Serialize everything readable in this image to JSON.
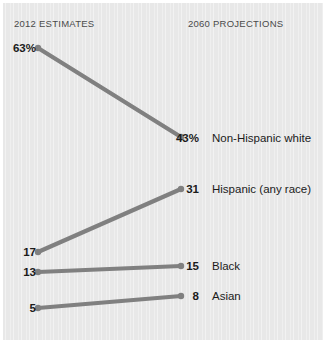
{
  "chart_data": {
    "type": "line",
    "title": "",
    "subtitle": "",
    "xlabel": "",
    "ylabel": "",
    "x": [
      "2012 ESTIMATES",
      "2060 PROJECTIONS"
    ],
    "legend_position": "right-of-endpoints",
    "grid": false,
    "unit": "percent of U.S. population",
    "series": [
      {
        "name": "Non-Hispanic white",
        "values": [
          63,
          43
        ],
        "start_label": "63%",
        "end_label": "43%",
        "start_px": {
          "x": 38,
          "y": 48
        },
        "end_px": {
          "x": 181,
          "y": 137
        }
      },
      {
        "name": "Hispanic (any race)",
        "values": [
          17,
          31
        ],
        "start_label": "17",
        "end_label": "31",
        "start_px": {
          "x": 38,
          "y": 252
        },
        "end_px": {
          "x": 181,
          "y": 189
        }
      },
      {
        "name": "Black",
        "values": [
          13,
          15
        ],
        "start_label": "13",
        "end_label": "15",
        "start_px": {
          "x": 38,
          "y": 272
        },
        "end_px": {
          "x": 181,
          "y": 266
        }
      },
      {
        "name": "Asian",
        "values": [
          5,
          8
        ],
        "start_label": "5",
        "end_label": "8",
        "start_px": {
          "x": 38,
          "y": 308
        },
        "end_px": {
          "x": 181,
          "y": 296
        }
      }
    ]
  },
  "headers": {
    "left": "2012 ESTIMATES",
    "right": "2060 PROJECTIONS"
  },
  "colors": {
    "line": "#808080",
    "panel_background": "#e8e8e8",
    "page_background": "#ffffff",
    "text": "#1b1b1b",
    "header_text": "#4a4a4a"
  },
  "labels": {
    "white": {
      "start": "63%",
      "end": "43%",
      "name": "Non-Hispanic white"
    },
    "hispanic": {
      "start": "17",
      "end": "31",
      "name": "Hispanic (any race)"
    },
    "black": {
      "start": "13",
      "end": "15",
      "name": "Black"
    },
    "asian": {
      "start": "5",
      "end": "8",
      "name": "Asian"
    }
  }
}
